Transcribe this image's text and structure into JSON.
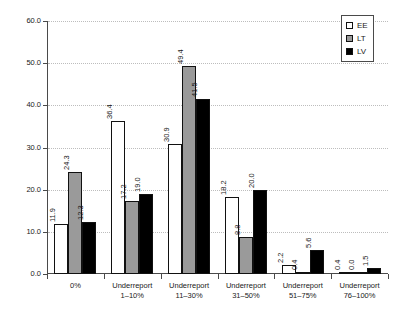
{
  "chart_data": {
    "type": "bar",
    "title": "",
    "subtitle": "",
    "xlabel": "",
    "ylabel": "",
    "ylim": [
      0.0,
      60.0
    ],
    "ytick_step": 10.0,
    "ytick_labels": [
      "0.0",
      "10.0",
      "20.0",
      "30.0",
      "40.0",
      "50.0",
      "60.0"
    ],
    "ytick_values": [
      0.0,
      10.0,
      20.0,
      30.0,
      40.0,
      50.0,
      60.0
    ],
    "grid": "horizontal-dotted",
    "legend_position": "top-right",
    "value_labels": "rotated-vertical-above-bars",
    "categories": [
      "0%",
      "Underreport 1–10%",
      "Underreport 11–30%",
      "Underreport 31–50%",
      "Underreport 51–75%",
      "Underreport 76–100%"
    ],
    "category_lines": [
      {
        "line1": "0%",
        "line2": ""
      },
      {
        "line1": "Underreport",
        "line2": "1–10%"
      },
      {
        "line1": "Underreport",
        "line2": "11–30%"
      },
      {
        "line1": "Underreport",
        "line2": "31–50%"
      },
      {
        "line1": "Underreport",
        "line2": "51–75%"
      },
      {
        "line1": "Underreport",
        "line2": "76–100%"
      }
    ],
    "series": [
      {
        "name": "EE",
        "color": "#ffffff",
        "values": [
          11.9,
          36.4,
          30.9,
          18.2,
          2.2,
          0.4
        ],
        "labels": [
          "11.9",
          "36.4",
          "30.9",
          "18.2",
          "2.2",
          "0.4"
        ]
      },
      {
        "name": "LT",
        "color": "#9a9a9a",
        "values": [
          24.3,
          17.2,
          49.4,
          8.8,
          0.4,
          0.0
        ],
        "labels": [
          "24.3",
          "17.2",
          "49.4",
          "8.8",
          "0.4",
          "0.0"
        ]
      },
      {
        "name": "LV",
        "color": "#000000",
        "values": [
          12.3,
          19.0,
          41.5,
          20.0,
          5.6,
          1.5
        ],
        "labels": [
          "12.3",
          "19.0",
          "41.5",
          "20.0",
          "5.6",
          "1.5"
        ]
      }
    ]
  },
  "legend": {
    "items": [
      {
        "label": "EE",
        "swatch": "white-open-square"
      },
      {
        "label": "LT",
        "swatch": "gray-filled-square"
      },
      {
        "label": "LV",
        "swatch": "black-filled-square"
      }
    ]
  }
}
